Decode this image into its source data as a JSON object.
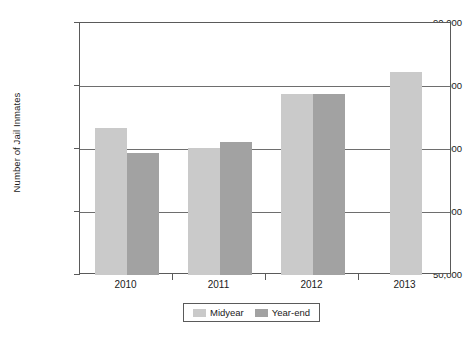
{
  "chart_data": {
    "type": "bar",
    "title": "",
    "xlabel": "",
    "ylabel": "Number of Jail Inmates",
    "categories": [
      "2010",
      "2011",
      "2012",
      "2013"
    ],
    "series": [
      {
        "name": "Midyear",
        "color": "#cacaca",
        "values": [
          73300,
          70200,
          78700,
          82200
        ]
      },
      {
        "name": "Year-end",
        "color": "#a2a2a2",
        "values": [
          69400,
          71100,
          78700,
          null
        ]
      }
    ],
    "ylim": [
      50000,
      90000
    ],
    "yticks": [
      50000,
      60000,
      70000,
      80000,
      90000
    ],
    "ytick_labels": [
      "50,000",
      "60,000",
      "70,000",
      "80,000",
      "90,000"
    ],
    "grid": true,
    "legend_position": "bottom",
    "legend_entries": [
      "Midyear",
      "Year-end"
    ]
  }
}
